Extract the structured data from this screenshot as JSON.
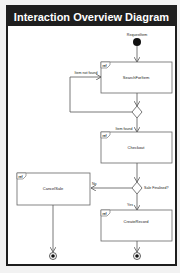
{
  "diagram": {
    "title": "Interaction Overview Diagram",
    "initial_node": {
      "label": "RequestItem"
    },
    "interactions": [
      {
        "id": "search",
        "tag": "ref",
        "label": "SearchForItem"
      },
      {
        "id": "checkout",
        "tag": "ref",
        "label": "Checkout"
      },
      {
        "id": "cancel",
        "tag": "ref",
        "label": "CancelSale"
      },
      {
        "id": "create",
        "tag": "ref",
        "label": "CreateRecord"
      }
    ],
    "decisions": [
      {
        "id": "d1",
        "guards": [
          "Item not found",
          "Item found"
        ]
      },
      {
        "id": "d2",
        "question": "Sale Finalised?",
        "guards": [
          "No",
          "Yes"
        ]
      }
    ],
    "final_nodes": 2,
    "colors": {
      "frame": "#1e1e1e",
      "title_text": "#ffffff",
      "line": "#555555",
      "box_border": "#666666"
    }
  }
}
